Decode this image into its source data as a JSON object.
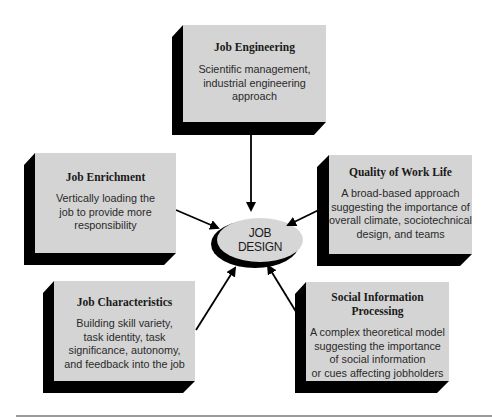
{
  "center": {
    "line1": "JOB",
    "line2": "DESIGN"
  },
  "boxes": [
    {
      "id": "job-engineering",
      "title": "Job Engineering",
      "description": [
        "Scientific management,",
        "industrial engineering",
        "approach"
      ]
    },
    {
      "id": "job-enrichment",
      "title": "Job Enrichment",
      "description": [
        "Vertically loading the",
        "job to provide more",
        "responsibility"
      ]
    },
    {
      "id": "quality-of-work-life",
      "title": "Quality of Work Life",
      "description": [
        "A broad-based approach",
        "suggesting the importance of",
        "overall climate, sociotechnical",
        "design, and teams"
      ]
    },
    {
      "id": "job-characteristics",
      "title": "Job Characteristics",
      "description": [
        "Building skill variety,",
        "task identity, task",
        "significance, autonomy,",
        "and feedback into the job"
      ]
    },
    {
      "id": "social-information-processing",
      "title_lines": [
        "Social Information",
        "Processing"
      ],
      "description": [
        "A complex theoretical model",
        "suggesting the importance",
        "of social information",
        "or cues affecting jobholders"
      ]
    }
  ],
  "colors": {
    "box_face": "#d4d4d4",
    "extrusion": "#000000",
    "oval_face": "#d6d6d6",
    "arrow": "#000000"
  }
}
